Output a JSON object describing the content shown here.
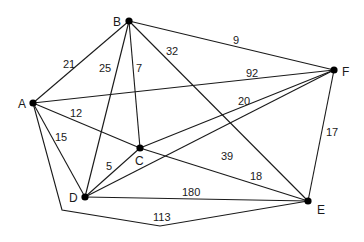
{
  "diagram": {
    "type": "weighted-graph",
    "nodes": [
      {
        "id": "A",
        "label": "A",
        "x": 33,
        "y": 103,
        "lx": 18,
        "ly": 108
      },
      {
        "id": "B",
        "label": "B",
        "x": 129,
        "y": 21,
        "lx": 113,
        "ly": 26
      },
      {
        "id": "C",
        "label": "C",
        "x": 140,
        "y": 148,
        "lx": 135,
        "ly": 165
      },
      {
        "id": "D",
        "label": "D",
        "x": 85,
        "y": 197,
        "lx": 69,
        "ly": 202
      },
      {
        "id": "E",
        "label": "E",
        "x": 308,
        "y": 201,
        "lx": 317,
        "ly": 214
      },
      {
        "id": "F",
        "label": "F",
        "x": 334,
        "y": 70,
        "lx": 342,
        "ly": 76
      }
    ],
    "edges": [
      {
        "from": "A",
        "to": "B",
        "weight": "21",
        "points": "33,103 129,21",
        "lx": 63,
        "ly": 68
      },
      {
        "from": "B",
        "to": "D",
        "weight": "25",
        "points": "129,21 85,197",
        "lx": 99,
        "ly": 72
      },
      {
        "from": "B",
        "to": "C",
        "weight": "7",
        "points": "129,21 140,148",
        "lx": 136,
        "ly": 72
      },
      {
        "from": "B",
        "to": "E",
        "weight": "32",
        "points": "129,21 308,201",
        "lx": 166,
        "ly": 55
      },
      {
        "from": "B",
        "to": "F",
        "weight": "9",
        "points": "129,21 334,70",
        "lx": 233,
        "ly": 44
      },
      {
        "from": "A",
        "to": "F",
        "weight": "92",
        "points": "33,103 334,70",
        "lx": 246,
        "ly": 77
      },
      {
        "from": "A",
        "to": "C",
        "weight": "12",
        "points": "33,103 140,148",
        "lx": 70,
        "ly": 117
      },
      {
        "from": "C",
        "to": "E",
        "weight": "18",
        "points": "140,148 308,201",
        "lx": 250,
        "ly": 180
      },
      {
        "from": "C",
        "to": "F",
        "weight": "20",
        "points": "140,148 334,70",
        "lx": 238,
        "ly": 105
      },
      {
        "from": "C",
        "to": "D",
        "weight": "5",
        "points": "140,148 85,197",
        "lx": 106,
        "ly": 170
      },
      {
        "from": "A",
        "to": "D",
        "weight": "15",
        "points": "33,103 85,197",
        "lx": 55,
        "ly": 141
      },
      {
        "from": "D",
        "to": "F",
        "weight": "39",
        "points": "85,197 334,70",
        "lx": 221,
        "ly": 160
      },
      {
        "from": "D",
        "to": "E",
        "weight": "180",
        "points": "85,197 308,201",
        "lx": 182,
        "ly": 196
      },
      {
        "from": "F",
        "to": "E",
        "weight": "17",
        "points": "334,70 308,201",
        "lx": 326,
        "ly": 136
      },
      {
        "from": "A",
        "to": "E",
        "weight": "113",
        "points": "33,103 62,210 160,226 308,201",
        "lx": 153,
        "ly": 221
      }
    ]
  }
}
